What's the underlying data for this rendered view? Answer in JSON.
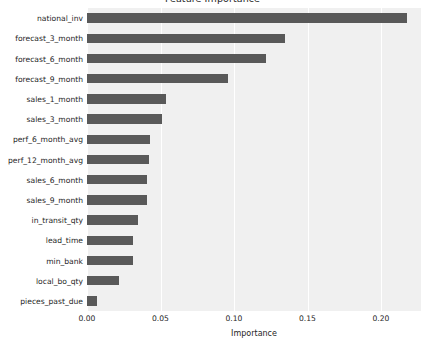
{
  "chart_data": {
    "type": "bar",
    "orientation": "horizontal",
    "title": "Feature Importance",
    "xlabel": "Importance",
    "ylabel": "",
    "xlim": [
      0.0,
      0.2272
    ],
    "xticks": [
      0.0,
      0.05,
      0.1,
      0.15,
      0.2
    ],
    "xtick_labels": [
      "0.00",
      "0.05",
      "0.10",
      "0.15",
      "0.20"
    ],
    "grid": "vertical-white-on-gray",
    "legend": null,
    "bar_color": "#595959",
    "plot_background": "#f0f0f0",
    "figure_background": "#ffffff",
    "categories": [
      "national_inv",
      "forecast_3_month",
      "forecast_6_month",
      "forecast_9_month",
      "sales_1_month",
      "sales_3_month",
      "perf_6_month_avg",
      "perf_12_month_avg",
      "sales_6_month",
      "sales_9_month",
      "in_transit_qty",
      "lead_time",
      "min_bank",
      "local_bo_qty",
      "pieces_past_due"
    ],
    "values": [
      0.218,
      0.135,
      0.122,
      0.096,
      0.054,
      0.051,
      0.043,
      0.042,
      0.041,
      0.041,
      0.035,
      0.031,
      0.031,
      0.022,
      0.007
    ]
  }
}
